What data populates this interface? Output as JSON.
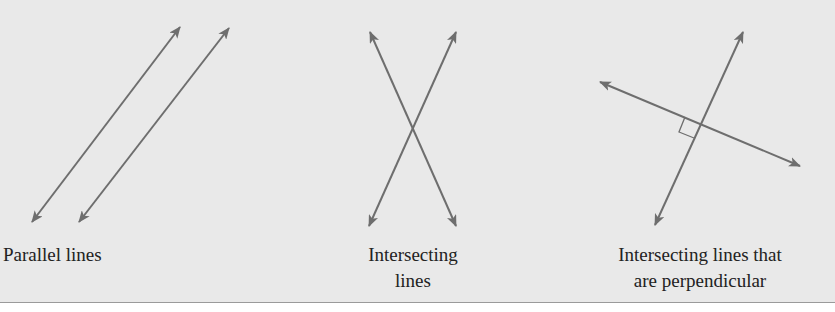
{
  "figure": {
    "background_color": "#e9e9e9",
    "line_color": "#6e6e6e",
    "diagrams": [
      {
        "id": "parallel",
        "caption_lines": [
          "Parallel lines"
        ]
      },
      {
        "id": "intersecting",
        "caption_lines": [
          "Intersecting",
          "lines"
        ]
      },
      {
        "id": "perpendicular",
        "caption_lines": [
          "Intersecting lines that",
          "are perpendicular"
        ],
        "right_angle_marker": true
      }
    ]
  }
}
